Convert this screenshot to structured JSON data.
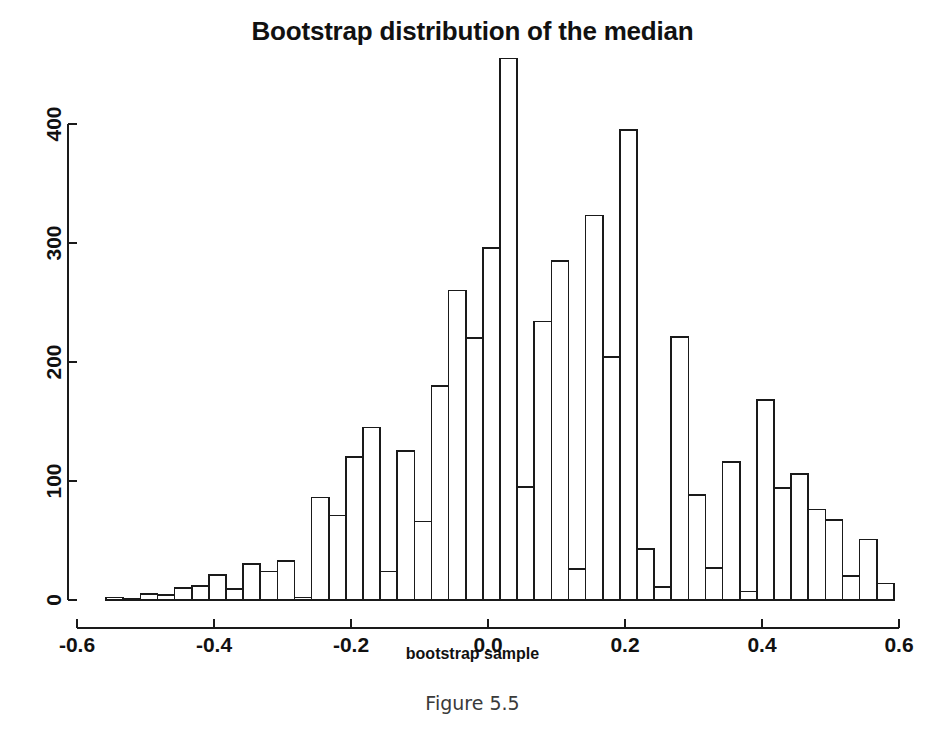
{
  "figure": {
    "caption": "Figure 5.5"
  },
  "chart_data": {
    "type": "bar",
    "title": "Bootstrap distribution of the median",
    "xlabel": "bootstrap sample",
    "ylabel": "",
    "xlim": [
      -0.6,
      0.6
    ],
    "ylim": [
      0,
      455
    ],
    "grid": false,
    "legend": null,
    "xticks": [
      -0.6,
      -0.4,
      -0.2,
      0.0,
      0.2,
      0.4,
      0.6
    ],
    "xtick_labels": [
      "-0.6",
      "-0.4",
      "-0.2",
      "0.0",
      "0.2",
      "0.4",
      "0.6"
    ],
    "yticks": [
      0,
      100,
      200,
      300,
      400
    ],
    "ytick_labels": [
      "0",
      "100",
      "200",
      "300",
      "400"
    ],
    "bin_width": 0.025,
    "bin_starts": [
      -0.5575,
      -0.5325,
      -0.5075,
      -0.4825,
      -0.4575,
      -0.4325,
      -0.4075,
      -0.3825,
      -0.3575,
      -0.3325,
      -0.3075,
      -0.2825,
      -0.2575,
      -0.2325,
      -0.2075,
      -0.1825,
      -0.1575,
      -0.1325,
      -0.1075,
      -0.0825,
      -0.0575,
      -0.0325,
      -0.0075,
      0.0175,
      0.0425,
      0.0675,
      0.0925,
      0.1175,
      0.1425,
      0.1675,
      0.1925,
      0.2175,
      0.2425,
      0.2675,
      0.2925,
      0.3175,
      0.3425,
      0.3675,
      0.3925,
      0.4175,
      0.4425,
      0.4675,
      0.4925,
      0.5175,
      0.5425,
      0.5675
    ],
    "values": [
      2,
      1,
      5,
      4,
      10,
      12,
      21,
      9,
      30,
      24,
      33,
      2,
      86,
      71,
      120,
      145,
      24,
      125,
      66,
      180,
      260,
      220,
      296,
      455,
      95,
      234,
      285,
      26,
      323,
      204,
      395,
      43,
      11,
      221,
      88,
      27,
      116,
      7,
      168,
      94,
      106,
      76,
      67,
      20,
      51,
      14
    ],
    "series": [
      {
        "name": "bootstrap median counts",
        "values": [
          2,
          1,
          5,
          4,
          10,
          12,
          21,
          9,
          30,
          24,
          33,
          2,
          86,
          71,
          120,
          145,
          24,
          125,
          66,
          180,
          260,
          220,
          296,
          455,
          95,
          234,
          285,
          26,
          323,
          204,
          395,
          43,
          11,
          221,
          88,
          27,
          116,
          7,
          168,
          94,
          106,
          76,
          67,
          20,
          51,
          14
        ]
      }
    ],
    "tail_bins": {
      "starts": [
        0.5425,
        0.5675
      ],
      "values": [
        5,
        8
      ]
    },
    "colors": {
      "bar_fill": "#ffffff",
      "bar_stroke": "#1a1a1a",
      "axis": "#1a1a1a",
      "text": "#111111"
    }
  }
}
